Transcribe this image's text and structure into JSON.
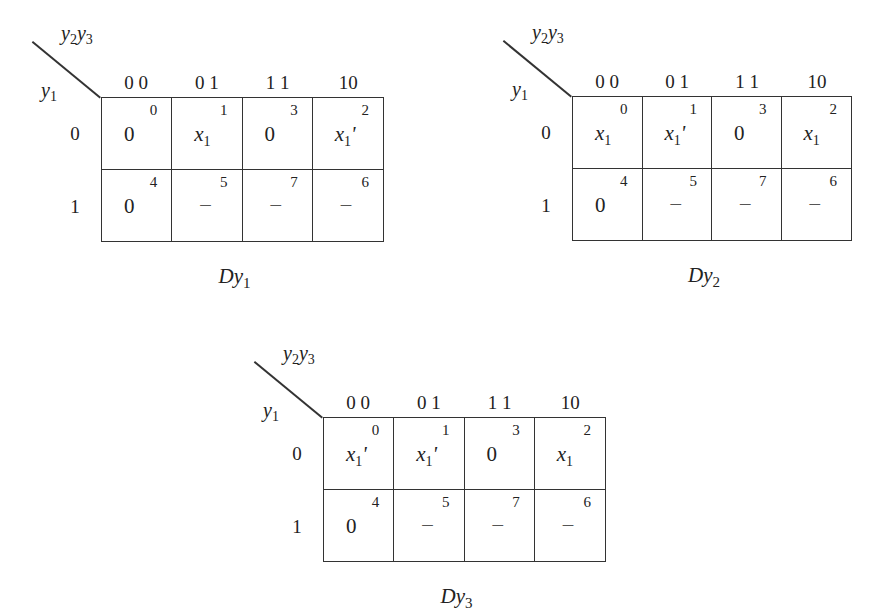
{
  "maps": [
    {
      "title_main": "Dy",
      "title_sub": "1",
      "col_var": "y2y3",
      "row_var": "y1",
      "col_headers": [
        "0 0",
        "0 1",
        "1 1",
        "10"
      ],
      "row_headers": [
        "0",
        "1"
      ],
      "rows": [
        [
          {
            "minterm": "0",
            "value": "0",
            "type": "const"
          },
          {
            "minterm": "1",
            "value": "x1",
            "type": "var"
          },
          {
            "minterm": "3",
            "value": "0",
            "type": "const"
          },
          {
            "minterm": "2",
            "value": "x1'",
            "type": "var"
          }
        ],
        [
          {
            "minterm": "4",
            "value": "0",
            "type": "const"
          },
          {
            "minterm": "5",
            "value": "–",
            "type": "dontcare"
          },
          {
            "minterm": "7",
            "value": "–",
            "type": "dontcare"
          },
          {
            "minterm": "6",
            "value": "–",
            "type": "dontcare"
          }
        ]
      ]
    },
    {
      "title_main": "Dy",
      "title_sub": "2",
      "col_var": "y2y3",
      "row_var": "y1",
      "col_headers": [
        "0 0",
        "0 1",
        "1 1",
        "10"
      ],
      "row_headers": [
        "0",
        "1"
      ],
      "rows": [
        [
          {
            "minterm": "0",
            "value": "x1",
            "type": "var"
          },
          {
            "minterm": "1",
            "value": "x1'",
            "type": "var"
          },
          {
            "minterm": "3",
            "value": "0",
            "type": "const"
          },
          {
            "minterm": "2",
            "value": "x1",
            "type": "var"
          }
        ],
        [
          {
            "minterm": "4",
            "value": "0",
            "type": "const"
          },
          {
            "minterm": "5",
            "value": "–",
            "type": "dontcare"
          },
          {
            "minterm": "7",
            "value": "–",
            "type": "dontcare"
          },
          {
            "minterm": "6",
            "value": "–",
            "type": "dontcare"
          }
        ]
      ]
    },
    {
      "title_main": "Dy",
      "title_sub": "3",
      "col_var": "y2y3",
      "row_var": "y1",
      "col_headers": [
        "0 0",
        "0 1",
        "1 1",
        "10"
      ],
      "row_headers": [
        "0",
        "1"
      ],
      "rows": [
        [
          {
            "minterm": "0",
            "value": "x1'",
            "type": "var"
          },
          {
            "minterm": "1",
            "value": "x1'",
            "type": "var"
          },
          {
            "minterm": "3",
            "value": "0",
            "type": "const"
          },
          {
            "minterm": "2",
            "value": "x1",
            "type": "var"
          }
        ],
        [
          {
            "minterm": "4",
            "value": "0",
            "type": "const"
          },
          {
            "minterm": "5",
            "value": "–",
            "type": "dontcare"
          },
          {
            "minterm": "7",
            "value": "–",
            "type": "dontcare"
          },
          {
            "minterm": "6",
            "value": "–",
            "type": "dontcare"
          }
        ]
      ]
    }
  ],
  "layout": [
    {
      "left": 101,
      "top": 97,
      "width": 283,
      "height": 145
    },
    {
      "left": 572,
      "top": 96,
      "width": 280,
      "height": 145
    },
    {
      "left": 323,
      "top": 417,
      "width": 283,
      "height": 145
    }
  ]
}
